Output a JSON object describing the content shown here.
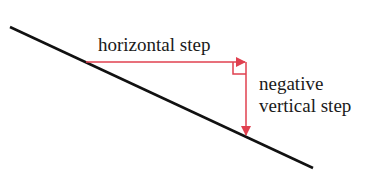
{
  "diagram": {
    "labels": {
      "horizontal": "horizontal step",
      "vertical_line1": "negative",
      "vertical_line2": "vertical step"
    },
    "colors": {
      "line": "#111111",
      "arrow": "#e0404f",
      "text": "#1a1a1a"
    }
  }
}
